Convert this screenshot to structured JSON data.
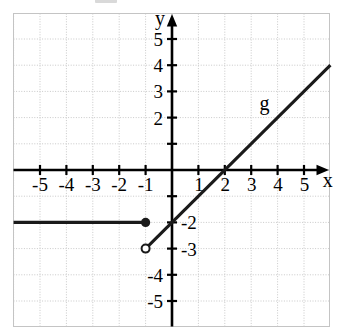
{
  "chart_data": {
    "type": "line",
    "title": "",
    "xlabel": "x",
    "ylabel": "y",
    "xlim": [
      -6,
      6
    ],
    "ylim": [
      -6,
      6
    ],
    "grid": true,
    "grid_step": 1,
    "legend": "none",
    "xticks": [
      -5,
      -4,
      -3,
      -2,
      -1,
      1,
      2,
      3,
      4,
      5
    ],
    "yticks": [
      5,
      4,
      3,
      2,
      -2,
      -3,
      -4,
      -5
    ],
    "xtick_labels": [
      "-5",
      "-4",
      "-3",
      "-2",
      "-1",
      "1",
      "2",
      "3",
      "4",
      "5"
    ],
    "ytick_labels": [
      "5",
      "4",
      "3",
      "2",
      "-2",
      "-3",
      "-4",
      "-5"
    ],
    "annotations": [
      {
        "text": "g",
        "x": 3.5,
        "y": 2.3,
        "name": "curve-label-g"
      },
      {
        "text": "x",
        "x": 5.9,
        "y": -0.65,
        "name": "x-axis-label"
      },
      {
        "text": "y",
        "x": -0.45,
        "y": 5.55,
        "name": "y-axis-label"
      }
    ],
    "series": [
      {
        "name": "g-horizontal-ray",
        "type": "segment",
        "equation": "y = -2",
        "points": [
          [
            -6.0,
            -2
          ],
          [
            -1,
            -2
          ]
        ],
        "start_marker": "none",
        "end_marker": "closed-dot"
      },
      {
        "name": "g-slanted-line",
        "type": "segment",
        "equation": "y = x - 2",
        "slope": 1,
        "intercept": -2,
        "points": [
          [
            -1,
            -3
          ],
          [
            6.0,
            4
          ]
        ],
        "start_marker": "open-circle",
        "end_marker": "none",
        "x_intercept": 2
      }
    ],
    "markers": [
      {
        "name": "closed-endpoint",
        "x": -1,
        "y": -2,
        "style": "filled"
      },
      {
        "name": "open-endpoint",
        "x": -1,
        "y": -3,
        "style": "hollow"
      }
    ]
  },
  "colors": {
    "axis": "#000000",
    "curve": "#1a1a1a",
    "grid_major": "#c8c8c8",
    "grid_minor": "#d8d8d8",
    "plot_border": "#c0c0c0",
    "background": "#ffffff",
    "label": "#000000"
  }
}
